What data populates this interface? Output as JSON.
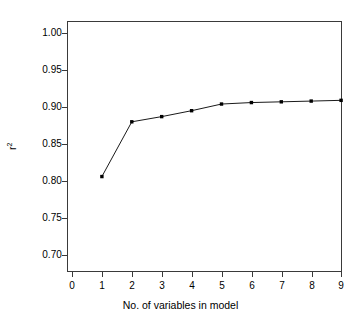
{
  "chart_data": {
    "type": "line",
    "title": "",
    "subtitle": "",
    "xlabel": "No. of variables in model",
    "ylabel": "r²",
    "ylabel_base": "r",
    "ylabel_sup": "2",
    "x": [
      1,
      2,
      3,
      4,
      5,
      6,
      7,
      8,
      9
    ],
    "values": [
      0.806,
      0.88,
      0.887,
      0.895,
      0.904,
      0.906,
      0.907,
      0.908,
      0.909
    ],
    "series": [
      {
        "name": "r²",
        "values": [
          0.806,
          0.88,
          0.887,
          0.895,
          0.904,
          0.906,
          0.907,
          0.908,
          0.909
        ]
      }
    ],
    "xlim": [
      0,
      9.35
    ],
    "ylim": [
      0.685,
      1.015
    ],
    "xticks": [
      0,
      1,
      2,
      3,
      4,
      5,
      6,
      7,
      8,
      9
    ],
    "xtick_labels": [
      "0",
      "1",
      "2",
      "3",
      "4",
      "5",
      "6",
      "7",
      "8",
      "9"
    ],
    "yticks": [
      0.7,
      0.75,
      0.8,
      0.85,
      0.9,
      0.95,
      1.0
    ],
    "ytick_labels": [
      "0.70",
      "0.75",
      "0.80",
      "0.85",
      "0.90",
      "0.95",
      "1.00"
    ],
    "grid": false,
    "legend": false,
    "legend_position": "none",
    "marker": "filled-square",
    "line_color": "#1a1a1a",
    "marker_color": "#000000",
    "frame_color": "#3a3a3a",
    "background_color": "#ffffff"
  }
}
